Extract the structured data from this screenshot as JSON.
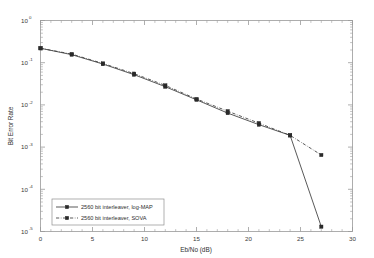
{
  "chart_data": {
    "type": "line",
    "title": "",
    "xlabel": "Eb/No (dB)",
    "ylabel": "Bit Error Rate",
    "xlim": [
      0,
      30
    ],
    "ylim": [
      1e-05,
      1
    ],
    "yscale": "log",
    "grid": false,
    "legend_position": "lower left",
    "x_ticks": [
      "0",
      "5",
      "10",
      "15",
      "20",
      "25",
      "30"
    ],
    "x_tick_values": [
      0,
      5,
      10,
      15,
      20,
      25,
      30
    ],
    "y_ticks": [
      "10^0",
      "10^-1",
      "10^-2",
      "10^-3",
      "10^-4",
      "10^-5"
    ],
    "y_tick_exponents": [
      "0",
      "-1",
      "-2",
      "-3",
      "-4",
      "-5"
    ],
    "y_tick_values": [
      1,
      0.1,
      0.01,
      0.001,
      0.0001,
      1e-05
    ],
    "x": [
      0,
      3,
      6,
      9,
      12,
      15,
      18,
      21,
      24,
      27
    ],
    "series": [
      {
        "name": "2560 bit interleaver, log-MAP",
        "style": "solid",
        "marker": "square",
        "values": [
          0.22,
          0.155,
          0.093,
          0.052,
          0.027,
          0.0132,
          0.0064,
          0.0034,
          0.0019,
          1.3e-05
        ]
      },
      {
        "name": "2560 bit interleaver, SOVA",
        "style": "dash-dot",
        "marker": "square",
        "values": [
          0.22,
          0.16,
          0.096,
          0.055,
          0.029,
          0.0138,
          0.0071,
          0.0037,
          0.0019,
          0.00065
        ]
      }
    ]
  },
  "legend": {
    "entries": [
      {
        "label": "2560 bit interleaver, log-MAP"
      },
      {
        "label": "2560 bit interleaver, SOVA"
      }
    ]
  },
  "axes": {
    "xlabel": "Eb/No (dB)",
    "ylabel": "Bit Error Rate",
    "x_tick_labels": [
      "0",
      "5",
      "10",
      "15",
      "20",
      "25",
      "30"
    ],
    "y_tick_bases": [
      "10",
      "10",
      "10",
      "10",
      "10",
      "10"
    ],
    "y_tick_exponents": [
      "0",
      "-1",
      "-2",
      "-3",
      "-4",
      "-5"
    ]
  },
  "colors": {
    "background": "#ffffff",
    "axis": "#9a9a9a",
    "series": "#3b3b3b",
    "text": "#2e2e2e"
  }
}
